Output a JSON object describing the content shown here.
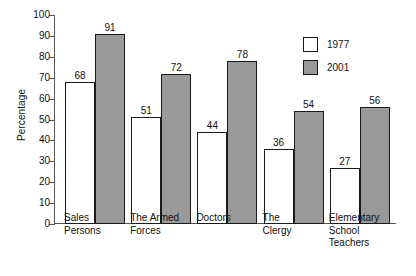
{
  "chart_data": {
    "type": "bar",
    "title": "",
    "xlabel": "",
    "ylabel": "Percentage",
    "ylim": [
      0,
      100
    ],
    "ytick_step": 10,
    "grid": false,
    "legend_position": "top-right",
    "categories": [
      "Sales\nPersons",
      "The Armed\nForces",
      "Doctors",
      "The\nClergy",
      "Elementary\nSchool\nTeachers"
    ],
    "yticks": [
      "100",
      "90",
      "80",
      "70",
      "60",
      "50",
      "40",
      "30",
      "20",
      "10",
      "0"
    ],
    "series": [
      {
        "name": "1977",
        "color": "#ffffff",
        "values": [
          68,
          51,
          44,
          36,
          27
        ]
      },
      {
        "name": "2001",
        "color": "#999999",
        "values": [
          91,
          72,
          78,
          54,
          56
        ]
      }
    ]
  },
  "legend": {
    "items": [
      {
        "label": "1977",
        "swatch": "white-square-icon"
      },
      {
        "label": "2001",
        "swatch": "gray-square-icon"
      }
    ]
  }
}
